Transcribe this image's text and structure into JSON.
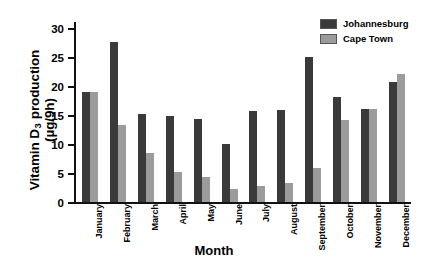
{
  "chart_data": {
    "type": "bar",
    "title": "",
    "xlabel": "Month",
    "ylabel_line1": "Vitamin D",
    "ylabel_sub": "3",
    "ylabel_line1_tail": " production",
    "ylabel_line2": "(µg/9h)",
    "categories": [
      "January",
      "February",
      "March",
      "April",
      "May",
      "June",
      "July",
      "August",
      "September",
      "October",
      "November",
      "December"
    ],
    "series": [
      {
        "name": "Johannesburg",
        "color": "#3a3a3a",
        "values": [
          19.0,
          27.5,
          15.2,
          14.8,
          14.3,
          10.0,
          15.7,
          15.8,
          25.0,
          18.0,
          16.0,
          20.6
        ]
      },
      {
        "name": "Cape Town",
        "color": "#9b9b9b",
        "values": [
          19.0,
          13.3,
          8.5,
          5.1,
          4.3,
          2.3,
          2.7,
          3.2,
          5.8,
          14.2,
          16.0,
          22.0
        ]
      }
    ],
    "ylim": [
      0,
      31
    ],
    "yticks": [
      0,
      5,
      10,
      15,
      20,
      25,
      30
    ],
    "ytick_labels": [
      "0",
      "5",
      "10",
      "15",
      "20",
      "25",
      "30"
    ],
    "grid": false,
    "legend_position": "top-right"
  },
  "legend": {
    "items": [
      {
        "label": "Johannesburg",
        "color": "#3a3a3a"
      },
      {
        "label": "Cape Town",
        "color": "#9b9b9b"
      }
    ]
  }
}
